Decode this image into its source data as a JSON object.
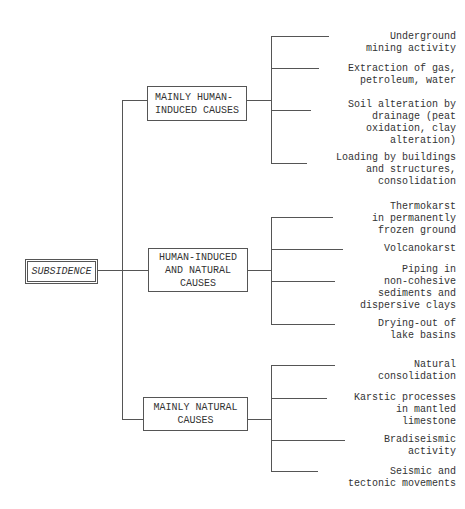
{
  "diagram": {
    "root": {
      "label": "SUBSIDENCE"
    },
    "categories": [
      {
        "label": "MAINLY HUMAN-\nINDUCED CAUSES",
        "items": [
          "Underground\nmining activity",
          "Extraction of gas,\npetroleum, water",
          "Soil alteration by\ndrainage (peat\noxidation, clay\nalteration)",
          "Loading by buildings\nand structures,\nconsolidation"
        ]
      },
      {
        "label": "HUMAN-INDUCED\nAND NATURAL\nCAUSES",
        "items": [
          "Thermokarst\nin permanently\nfrozen ground",
          "Volcanokarst",
          "Piping in\nnon-cohesive\nsediments and\ndispersive clays",
          "Drying-out of\nlake basins"
        ]
      },
      {
        "label": "MAINLY NATURAL\nCAUSES",
        "items": [
          "Natural\nconsolidation",
          "Karstic processes\nin mantled\nlimestone",
          "Bradiseismic\nactivity",
          "Seismic and\ntectonic movements"
        ]
      }
    ]
  },
  "colors": {
    "line": "#555555",
    "text": "#333333",
    "background": "#ffffff"
  }
}
